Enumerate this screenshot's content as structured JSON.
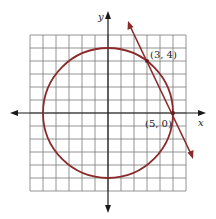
{
  "diagram": {
    "type": "coordinate-plane",
    "axes": {
      "x_label": "x",
      "y_label": "y"
    },
    "grid": {
      "min": -6,
      "max": 6,
      "step": 1
    },
    "circle": {
      "center": [
        0,
        0
      ],
      "radius": 5,
      "equation": "x^2 + y^2 = 25"
    },
    "line": {
      "through": [
        [
          3,
          4
        ],
        [
          5,
          0
        ]
      ]
    },
    "points": [
      {
        "label": "(3, 4)",
        "x": 3,
        "y": 4
      },
      {
        "label": "(5, 0)",
        "x": 5,
        "y": 0
      }
    ],
    "colors": {
      "curve": "#8b2a2a",
      "grid": "#7a7a7a",
      "axis": "#1a1a1a"
    }
  }
}
